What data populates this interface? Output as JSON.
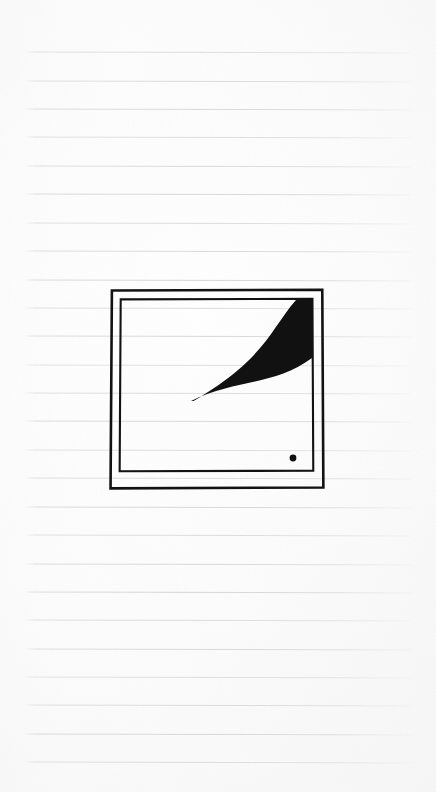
{
  "page": {
    "width": 436,
    "height": 792,
    "background_color": "#fcfcfc",
    "description": "Scanned sheet of lined notebook paper with a hand-inked sketch"
  },
  "paper": {
    "kind": "ruled-notebook-paper",
    "line_color": "#d6d6da",
    "line_count": 26,
    "first_line_y": 52,
    "line_spacing": 28.4,
    "line_left_x": 24,
    "line_right_x": 413
  },
  "sketch": {
    "name": "framed-swoosh-drawing",
    "ink_color": "#111111",
    "outer_frame": {
      "x": 111,
      "y": 290,
      "width": 212,
      "height": 198,
      "stroke_width": 2.6
    },
    "inner_frame": {
      "x": 120,
      "y": 299,
      "width": 193,
      "height": 172,
      "stroke_width": 2.1
    },
    "swoosh": {
      "label": "tapered-crescent-stroke",
      "tip_x": 191,
      "tip_y": 401,
      "anchor_x": 312,
      "anchor_y": 300,
      "fill": "#111111"
    },
    "dot": {
      "label": "ink-dot",
      "cx": 293,
      "cy": 458,
      "r": 3.4,
      "fill": "#111111"
    }
  }
}
